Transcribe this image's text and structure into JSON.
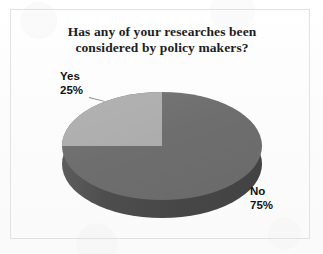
{
  "chart_data": {
    "type": "pie",
    "title": "Has any of your researches been considered by policy makers?",
    "title_line1": "Has any of your researches been",
    "title_line2": "considered by policy makers?",
    "categories": [
      "Yes",
      "No"
    ],
    "values": [
      25,
      75
    ],
    "value_labels": [
      "25%",
      "75%"
    ],
    "units": "percent",
    "legend": "none",
    "labels_position": "outside",
    "three_d": true,
    "slices": [
      {
        "name": "Yes",
        "label": "Yes",
        "value": 25,
        "value_label": "25%",
        "color": "#adadad"
      },
      {
        "name": "No",
        "label": "No",
        "value": 75,
        "value_label": "75%",
        "color": "#6e6e6e"
      }
    ],
    "xlabel": "",
    "ylabel": ""
  },
  "colors": {
    "slice_yes": "#adadad",
    "slice_no": "#6e6e6e",
    "pie_side": "#4a4a4a",
    "title_text": "#1d1d1d",
    "label_text": "#121212",
    "frame_border": "#e2e2e2",
    "background": "#fbfbfb"
  }
}
